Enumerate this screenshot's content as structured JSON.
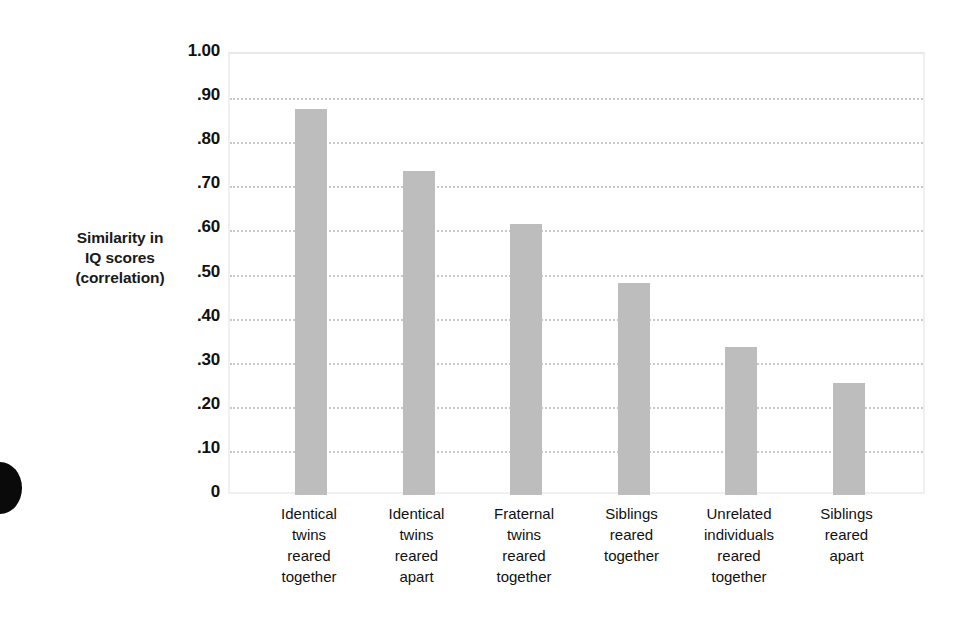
{
  "chart_data": {
    "type": "bar",
    "title": "",
    "xlabel": "",
    "ylabel": "Similarity in IQ scores (correlation)",
    "ylabel_lines": [
      "Similarity in",
      "IQ scores",
      "(correlation)"
    ],
    "ylim": [
      0,
      1.0
    ],
    "ytick_values": [
      1.0,
      0.9,
      0.8,
      0.7,
      0.6,
      0.5,
      0.4,
      0.3,
      0.2,
      0.1,
      0
    ],
    "ytick_labels": [
      "1.00",
      ".90",
      ".80",
      ".70",
      ".60",
      ".50",
      ".40",
      ".30",
      ".20",
      ".10",
      "0"
    ],
    "grid": true,
    "grid_style": "dotted",
    "legend": "none",
    "bar_color": "#bdbdbd",
    "frame_color": "#f0f0f0",
    "gridline_color": "#c9c9c9",
    "categories": [
      "Identical twins reared together",
      "Identical twins reared apart",
      "Fraternal twins reared together",
      "Siblings reared together",
      "Unrelated individuals reared together",
      "Siblings reared apart"
    ],
    "category_lines": [
      [
        "Identical",
        "twins",
        "reared",
        "together"
      ],
      [
        "Identical",
        "twins",
        "reared",
        "apart"
      ],
      [
        "Fraternal",
        "twins",
        "reared",
        "together"
      ],
      [
        "Siblings",
        "reared",
        "together"
      ],
      [
        "Unrelated",
        "individuals",
        "reared",
        "together"
      ],
      [
        "Siblings",
        "reared",
        "apart"
      ]
    ],
    "values": [
      0.875,
      0.735,
      0.615,
      0.48,
      0.335,
      0.255
    ]
  }
}
